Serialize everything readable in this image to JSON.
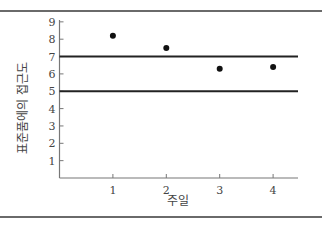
{
  "chart_data": {
    "type": "scatter",
    "title": "",
    "xlabel": "주일",
    "ylabel": "표준품에의 접근도",
    "x": [
      1,
      2,
      3,
      4
    ],
    "series": [
      {
        "name": "측정값",
        "values": [
          8.2,
          7.5,
          6.3,
          6.4
        ]
      }
    ],
    "reference_lines": [
      {
        "axis": "y",
        "value": 7,
        "label": "상한"
      },
      {
        "axis": "y",
        "value": 5,
        "label": "하한"
      }
    ],
    "xticks": [
      "1",
      "2",
      "3",
      "4"
    ],
    "yticks": [
      "1",
      "2",
      "3",
      "4",
      "5",
      "6",
      "7",
      "8",
      "9"
    ],
    "xlim": [
      0,
      4.5
    ],
    "ylim": [
      0,
      9
    ],
    "grid": false,
    "legend": "none"
  },
  "colors": {
    "points": "#111111",
    "reference_line": "#222222",
    "axis": "#777777",
    "frame_rule": "#6a6a6a"
  }
}
